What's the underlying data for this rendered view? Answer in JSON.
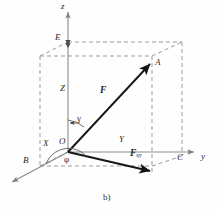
{
  "figure": {
    "caption": "b)",
    "colors": {
      "axis": "#8a8a8a",
      "dashed": "#9a9a9a",
      "vector": "#1a1a1a",
      "text": "#2b2b2b",
      "background": "#fefefe"
    }
  },
  "axes": [
    {
      "id": "z",
      "label": "z",
      "x": 61,
      "y": 2,
      "direction": "up"
    },
    {
      "id": "y",
      "label": "y",
      "x": 201,
      "y": 153,
      "direction": "right"
    },
    {
      "id": "x",
      "label": "x",
      "x": 10,
      "y": 184,
      "direction": "down-left"
    }
  ],
  "points": [
    {
      "id": "O",
      "label": "O",
      "x": 60,
      "y": 138
    },
    {
      "id": "E",
      "label": "E",
      "x": 55,
      "y": 34
    },
    {
      "id": "A",
      "label": "A",
      "x": 155,
      "y": 59
    },
    {
      "id": "B",
      "label": "B",
      "x": 24,
      "y": 157
    },
    {
      "id": "C",
      "label": "C",
      "x": 178,
      "y": 153
    }
  ],
  "components": [
    {
      "id": "Z",
      "label": "Z",
      "x": 61,
      "y": 85
    },
    {
      "id": "X",
      "label": "X",
      "x": 44,
      "y": 140
    },
    {
      "id": "Y",
      "label": "Y",
      "x": 120,
      "y": 136
    }
  ],
  "vectors": [
    {
      "id": "F",
      "label": "F",
      "x": 101,
      "y": 87,
      "from": "O",
      "to": "A"
    },
    {
      "id": "Fxy",
      "label": "F",
      "subscript": "xy",
      "x": 131,
      "y": 150,
      "from": "O",
      "to": "D"
    }
  ],
  "angles": [
    {
      "id": "gamma",
      "label": "γ",
      "x": 77,
      "y": 116,
      "between": "z-axis and F"
    },
    {
      "id": "phi",
      "label": "φ",
      "x": 64,
      "y": 156,
      "between": "x-axis and Fxy"
    }
  ]
}
